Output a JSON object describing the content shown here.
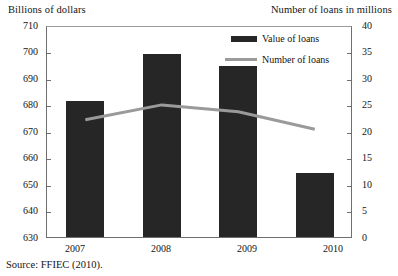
{
  "chart_data": {
    "type": "bar",
    "title": "",
    "categories": [
      "2007",
      "2008",
      "2009",
      "2010"
    ],
    "series": [
      {
        "name": "Value of loans",
        "type": "bar",
        "axis": "left",
        "color": "#262626",
        "values": [
          681.5,
          699.0,
          694.5,
          654.0
        ]
      },
      {
        "name": "Number of loans",
        "type": "line",
        "axis": "right",
        "color": "#9a9a9a",
        "values": [
          22.5,
          25.3,
          24.0,
          20.7
        ]
      }
    ],
    "xlabel": "",
    "ylabel": "Billions of dollars",
    "y2label": "Number of loans in millions",
    "ylim": [
      630,
      710
    ],
    "y2lim": [
      0,
      40
    ],
    "yticks": [
      630,
      640,
      650,
      660,
      670,
      680,
      690,
      700,
      710
    ],
    "y2ticks": [
      0,
      5,
      10,
      15,
      20,
      25,
      30,
      35,
      40
    ],
    "grid": false,
    "legend_position": "top-center-right"
  },
  "axes": {
    "left_title": "Billions of dollars",
    "right_title": "Number of loans in millions",
    "left_ticks": [
      "710",
      "700",
      "690",
      "680",
      "670",
      "660",
      "650",
      "640",
      "630"
    ],
    "right_ticks": [
      "40",
      "35",
      "30",
      "25",
      "20",
      "15",
      "10",
      "5",
      "0"
    ],
    "x_ticks": [
      "2007",
      "2008",
      "2009",
      "2010"
    ]
  },
  "legend": {
    "items": [
      {
        "label": "Value of loans",
        "marker": "bar-swatch"
      },
      {
        "label": "Number of loans",
        "marker": "line-swatch"
      }
    ]
  },
  "footer": {
    "source": "Source:  FFIEC (2010)."
  }
}
